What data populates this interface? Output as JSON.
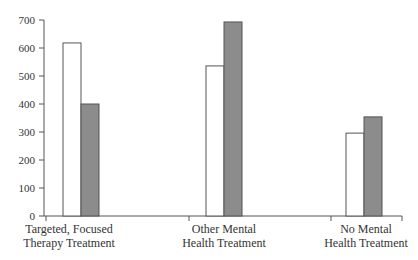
{
  "chart_data": {
    "type": "bar",
    "title": "",
    "xlabel": "",
    "ylabel": "",
    "ylim": [
      0,
      700
    ],
    "yticks": [
      0,
      100,
      200,
      300,
      400,
      500,
      600,
      700
    ],
    "grid": false,
    "legend": null,
    "categories": [
      "Targeted, Focused Therapy Treatment",
      "Other Mental Health Treatment",
      "No Mental Health Treatment"
    ],
    "category_lines": [
      [
        "Targeted, Focused",
        "Therapy Treatment"
      ],
      [
        "Other Mental",
        "Health Treatment"
      ],
      [
        "No Mental",
        "Health Treatment"
      ]
    ],
    "series": [
      {
        "name": "Series 1 (white)",
        "color": "#ffffff",
        "values": [
          618,
          536,
          296
        ]
      },
      {
        "name": "Series 2 (gray)",
        "color": "#8c8c8c",
        "values": [
          400,
          693,
          354
        ]
      }
    ]
  },
  "colors": {
    "axis": "#555555",
    "bar_outline": "#555555"
  }
}
